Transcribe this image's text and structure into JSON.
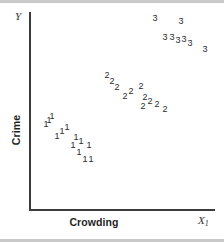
{
  "figure": {
    "width": 224,
    "height": 242,
    "background": "#ffffff",
    "axis_color": "#3c3c3c",
    "marker_color": "#2b2b2b"
  },
  "labels": {
    "y_axis_variable": "Y",
    "x_axis_variable": "X",
    "x_axis_variable_subscript": "1",
    "y_axis_title": "Crime",
    "x_axis_title": "Crowding"
  },
  "chart_data": {
    "type": "scatter",
    "title": "",
    "subtitle": "",
    "xlabel": "Crowding",
    "ylabel": "Crime",
    "x_axis_symbol": "X1",
    "y_axis_symbol": "Y",
    "grid": false,
    "legend": "none",
    "axis_ticks": false,
    "xlim": [
      0,
      100
    ],
    "ylim": [
      0,
      100
    ],
    "marker_style": "group-number-label",
    "series": [
      {
        "name": "1",
        "label": "1",
        "count": 13,
        "points": [
          {
            "x": 12.0,
            "y": 50.0
          },
          {
            "x": 9.0,
            "y": 45.5
          },
          {
            "x": 18.5,
            "y": 44.0
          },
          {
            "x": 15.5,
            "y": 39.0
          },
          {
            "x": 24.0,
            "y": 38.5
          },
          {
            "x": 22.0,
            "y": 34.0
          },
          {
            "x": 29.5,
            "y": 33.5
          },
          {
            "x": 26.0,
            "y": 29.0
          },
          {
            "x": 30.5,
            "y": 25.0
          },
          {
            "x": 33.5,
            "y": 24.0
          },
          {
            "x": 20.0,
            "y": 41.5
          },
          {
            "x": 27.5,
            "y": 36.0
          },
          {
            "x": 13.5,
            "y": 47.5
          }
        ]
      },
      {
        "name": "2",
        "label": "2",
        "count": 11,
        "points": [
          {
            "x": 45.0,
            "y": 72.0
          },
          {
            "x": 50.5,
            "y": 66.0
          },
          {
            "x": 58.5,
            "y": 66.5
          },
          {
            "x": 52.5,
            "y": 61.5
          },
          {
            "x": 61.0,
            "y": 61.0
          },
          {
            "x": 60.0,
            "y": 56.5
          },
          {
            "x": 66.5,
            "y": 57.0
          },
          {
            "x": 70.5,
            "y": 54.5
          },
          {
            "x": 55.0,
            "y": 63.5
          },
          {
            "x": 63.5,
            "y": 59.0
          },
          {
            "x": 48.0,
            "y": 69.0
          }
        ]
      },
      {
        "name": "3",
        "label": "3",
        "count": 8,
        "points": [
          {
            "x": 71.0,
            "y": 95.5
          },
          {
            "x": 85.0,
            "y": 93.5
          },
          {
            "x": 76.5,
            "y": 88.0
          },
          {
            "x": 80.0,
            "y": 88.0
          },
          {
            "x": 86.5,
            "y": 87.0
          },
          {
            "x": 90.0,
            "y": 85.0
          },
          {
            "x": 94.5,
            "y": 82.5
          },
          {
            "x": 83.0,
            "y": 86.0
          }
        ]
      }
    ]
  },
  "markers": [
    {
      "label": "3",
      "left": 155,
      "top": 18
    },
    {
      "label": "3",
      "left": 181,
      "top": 21
    },
    {
      "label": "3",
      "left": 165,
      "top": 37
    },
    {
      "label": "3",
      "left": 172,
      "top": 37
    },
    {
      "label": "3",
      "left": 184,
      "top": 39
    },
    {
      "label": "3",
      "left": 190,
      "top": 43
    },
    {
      "label": "3",
      "left": 205,
      "top": 49
    },
    {
      "label": "3",
      "left": 178,
      "top": 40
    },
    {
      "label": "2",
      "left": 107,
      "top": 75
    },
    {
      "label": "2",
      "left": 117,
      "top": 87
    },
    {
      "label": "2",
      "left": 141,
      "top": 86
    },
    {
      "label": "2",
      "left": 125,
      "top": 96
    },
    {
      "label": "2",
      "left": 145,
      "top": 97
    },
    {
      "label": "2",
      "left": 143,
      "top": 106
    },
    {
      "label": "2",
      "left": 157,
      "top": 104
    },
    {
      "label": "2",
      "left": 165,
      "top": 109
    },
    {
      "label": "2",
      "left": 131,
      "top": 91
    },
    {
      "label": "2",
      "left": 150,
      "top": 101
    },
    {
      "label": "2",
      "left": 112,
      "top": 81
    },
    {
      "label": "1",
      "left": 52,
      "top": 116
    },
    {
      "label": "1",
      "left": 46,
      "top": 124
    },
    {
      "label": "1",
      "left": 67,
      "top": 127
    },
    {
      "label": "1",
      "left": 57,
      "top": 136
    },
    {
      "label": "1",
      "left": 76,
      "top": 137
    },
    {
      "label": "1",
      "left": 73,
      "top": 145
    },
    {
      "label": "1",
      "left": 89,
      "top": 145
    },
    {
      "label": "1",
      "left": 79,
      "top": 152
    },
    {
      "label": "1",
      "left": 85,
      "top": 159
    },
    {
      "label": "1",
      "left": 91,
      "top": 159
    },
    {
      "label": "1",
      "left": 62,
      "top": 131
    },
    {
      "label": "1",
      "left": 81,
      "top": 141
    },
    {
      "label": "1",
      "left": 49,
      "top": 120
    }
  ]
}
